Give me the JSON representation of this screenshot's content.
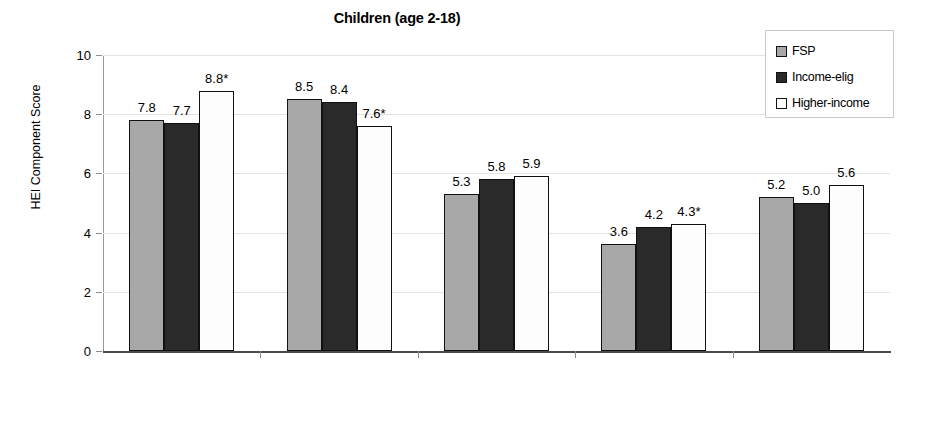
{
  "chart_data": {
    "type": "bar",
    "title": "Children (age 2-18)",
    "xlabel": "",
    "ylabel": "HEI Component Score",
    "ylim": [
      0,
      10
    ],
    "yticks": [
      "0",
      "2",
      "4",
      "6",
      "8",
      "10"
    ],
    "grid": true,
    "legend_position": "top-right",
    "categories": [
      "Milk/ milk products",
      "Meat & beans",
      "Oils",
      "Saturated fat",
      "Sodium"
    ],
    "series": [
      {
        "name": "FSP",
        "color": "#a8a8a8",
        "values": [
          7.8,
          8.5,
          5.3,
          3.6,
          5.2
        ],
        "labels": [
          "7.8",
          "8.5",
          "5.3",
          "3.6",
          "5.2"
        ]
      },
      {
        "name": "Income-elig",
        "color": "#2a2a2a",
        "values": [
          7.7,
          8.4,
          5.8,
          4.2,
          5.0
        ],
        "labels": [
          "7.7",
          "8.4",
          "5.8",
          "4.2",
          "5.0"
        ]
      },
      {
        "name": "Higher-income",
        "color": "#ffffff",
        "values": [
          8.8,
          7.6,
          5.9,
          4.3,
          5.6
        ],
        "labels": [
          "8.8*",
          "7.6*",
          "5.9",
          "4.3*",
          "5.6"
        ]
      }
    ]
  },
  "legend": {
    "items": [
      {
        "label": "FSP",
        "swatch": "fsp"
      },
      {
        "label": "Income-elig",
        "swatch": "inc"
      },
      {
        "label": "Higher-income",
        "swatch": "high"
      }
    ]
  }
}
